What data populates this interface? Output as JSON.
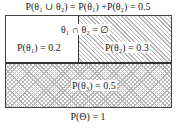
{
  "title": "P(θ₁ ∪ θ₂) = P(θ₁) +P(θ₂) = 0.5",
  "regions": {
    "theta1": {
      "label": "P(θ₁) = 0.2",
      "value": 0.2,
      "fill": "none"
    },
    "theta2": {
      "label": "P(θ₂) = 0.3",
      "value": 0.3,
      "fill": "diagonal-hatch"
    },
    "theta3": {
      "label": "P(θ₃) = 0.5",
      "value": 0.5,
      "fill": "cross-hatch"
    }
  },
  "intersection_label": "θ₁ ∩ θ₂ = ∅",
  "footer": "P(Θ) = 1",
  "colors": {
    "border": "#444444",
    "hatch": "#b5b5b5",
    "background": "#ffffff"
  }
}
